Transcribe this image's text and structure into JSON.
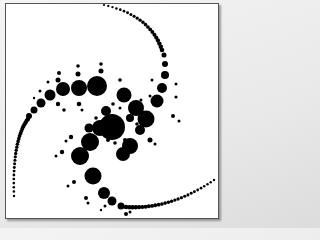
{
  "artwork": {
    "description": "Spiral fractal of black circles on white background in a thin frame",
    "colors": {
      "ink": "#000000",
      "paper": "#ffffff",
      "frame": "#555555"
    },
    "big_circles": [
      [
        112,
        127,
        13
      ],
      [
        97,
        86,
        10
      ],
      [
        79,
        88,
        8
      ],
      [
        63,
        89,
        7
      ],
      [
        50,
        95,
        5.5
      ],
      [
        41,
        103,
        4.5
      ],
      [
        34,
        110,
        3.5
      ],
      [
        29,
        116,
        3
      ],
      [
        124,
        95,
        7.5
      ],
      [
        136,
        108,
        8
      ],
      [
        146,
        119,
        8.5
      ],
      [
        157,
        101,
        6.5
      ],
      [
        162,
        88,
        5
      ],
      [
        165,
        75,
        4
      ],
      [
        165,
        64,
        3
      ],
      [
        164,
        55,
        2.5
      ],
      [
        90,
        142,
        9
      ],
      [
        80,
        156,
        9
      ],
      [
        93,
        176,
        8.5
      ],
      [
        104,
        193,
        6
      ],
      [
        112,
        201,
        4.5
      ],
      [
        121,
        206,
        3.5
      ],
      [
        130,
        146,
        8
      ],
      [
        100,
        128,
        8
      ],
      [
        123,
        154,
        7
      ],
      [
        140,
        130,
        5
      ],
      [
        106,
        111,
        5
      ],
      [
        89,
        128,
        4.5
      ],
      [
        130,
        118,
        4
      ]
    ],
    "small_dots": [
      [
        59,
        73,
        2
      ],
      [
        58,
        80,
        2.5
      ],
      [
        78,
        66,
        1.8
      ],
      [
        78,
        74,
        2.5
      ],
      [
        101,
        64,
        1.8
      ],
      [
        101,
        71,
        2.5
      ],
      [
        120,
        80,
        1.8
      ],
      [
        48,
        82,
        1.5
      ],
      [
        40,
        91,
        1.5
      ],
      [
        34,
        98,
        1.2
      ],
      [
        58,
        104,
        2.2
      ],
      [
        64,
        110,
        1.8
      ],
      [
        79,
        104,
        2.3
      ],
      [
        82,
        110,
        1.5
      ],
      [
        176,
        84,
        1.5
      ],
      [
        176,
        97,
        1.6
      ],
      [
        152,
        80,
        1.5
      ],
      [
        150,
        96,
        1.5
      ],
      [
        173,
        116,
        2
      ],
      [
        179,
        121,
        1.5
      ],
      [
        150,
        140,
        2.5
      ],
      [
        155,
        144,
        1.5
      ],
      [
        71,
        137,
        2.2
      ],
      [
        66,
        141,
        1.5
      ],
      [
        62,
        152,
        2.2
      ],
      [
        56,
        156,
        1.5
      ],
      [
        74,
        182,
        2
      ],
      [
        68,
        186,
        1.5
      ],
      [
        86,
        198,
        2
      ],
      [
        88,
        203,
        1.5
      ],
      [
        105,
        206,
        1.5
      ],
      [
        101,
        210,
        1.2
      ],
      [
        126,
        214,
        2
      ],
      [
        130,
        212,
        1.5
      ],
      [
        118,
        134,
        2
      ],
      [
        108,
        140,
        2
      ],
      [
        125,
        140,
        2
      ],
      [
        115,
        143,
        1.8
      ],
      [
        137,
        124,
        1.8
      ],
      [
        96,
        118,
        1.8
      ],
      [
        113,
        104,
        1.8
      ],
      [
        120,
        108,
        1.5
      ],
      [
        141,
        100,
        1.5
      ]
    ],
    "tail_top": {
      "from": [
        104,
        5
      ],
      "to": [
        162,
        50
      ],
      "count": 22,
      "r_start": 1.1,
      "r_end": 2.3
    },
    "tail_left": {
      "from": [
        28,
        119
      ],
      "to": [
        14,
        196
      ],
      "count": 26,
      "r_start": 2.2,
      "r_end": 1.2
    },
    "tail_bottom": {
      "from": [
        126,
        207
      ],
      "to": [
        214,
        180
      ],
      "count": 28,
      "r_start": 2.3,
      "r_end": 1.2
    }
  }
}
